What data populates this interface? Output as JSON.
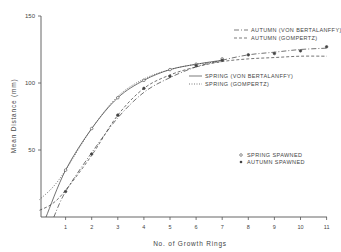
{
  "chart_data": {
    "type": "line",
    "title": "",
    "xlabel": "No. of Growth Rings",
    "ylabel": "Mean Distance (mm)",
    "xlim": [
      0,
      11
    ],
    "ylim": [
      0,
      150
    ],
    "x_ticks": [
      1,
      2,
      3,
      4,
      5,
      6,
      7,
      8,
      9,
      10,
      11
    ],
    "y_ticks": [
      50,
      100,
      150
    ],
    "grid": false,
    "legend_position": "upper-right / center-right",
    "series": [
      {
        "name": "AUTUMN (VON BERTALANFFY)",
        "style": "long-dash-dot",
        "x": [
          0.55,
          1,
          2,
          3,
          4,
          5,
          6,
          7,
          8,
          9,
          10,
          11
        ],
        "y": [
          0,
          19,
          48,
          74,
          93,
          104,
          112,
          117,
          121,
          123,
          125,
          126
        ]
      },
      {
        "name": "AUTUMN (GOMPERTZ)",
        "style": "dashed",
        "x": [
          0,
          0.5,
          1,
          2,
          3,
          4,
          5,
          6,
          7,
          8,
          9,
          10,
          11
        ],
        "y": [
          5,
          10,
          20,
          46,
          76,
          96,
          106,
          112,
          116,
          118,
          119,
          120,
          120
        ]
      },
      {
        "name": "SPRING (VON BERTALANFFY)",
        "style": "solid",
        "x": [
          0.25,
          1,
          2,
          3,
          4,
          5,
          6,
          7
        ],
        "y": [
          0,
          35,
          66,
          89,
          102,
          110,
          114,
          117
        ]
      },
      {
        "name": "SPRING (GOMPERTZ)",
        "style": "dotted",
        "x": [
          0,
          0.5,
          1,
          2,
          3,
          4,
          5,
          6,
          7
        ],
        "y": [
          13,
          22,
          35,
          66,
          90,
          103,
          110,
          114,
          116
        ]
      }
    ],
    "points": [
      {
        "name": "SPRING SPAWNED",
        "marker": "open-circle",
        "x": [
          1,
          2,
          3,
          4,
          5,
          6,
          7
        ],
        "y": [
          35,
          66,
          89,
          102,
          110,
          114,
          118
        ]
      },
      {
        "name": "AUTUMN SPAWNED",
        "marker": "filled-circle",
        "x": [
          1,
          2,
          3,
          4,
          5,
          6,
          7,
          8,
          9,
          10,
          11
        ],
        "y": [
          19,
          47,
          76,
          96,
          105,
          113,
          117,
          121,
          122,
          124,
          127
        ]
      }
    ]
  },
  "legend": {
    "autumn_vb": "AUTUMN (VON BERTALANFFY)",
    "autumn_gomp": "AUTUMN (GOMPERTZ)",
    "spring_vb": "SPRING (VON BERTALANFFY)",
    "spring_gomp": "SPRING (GOMPERTZ)",
    "spring_spawned": "SPRING SPAWNED",
    "autumn_spawned": "AUTUMN SPAWNED"
  },
  "axes": {
    "xlabel": "No. of Growth Rings",
    "ylabel": "Mean Distance (mm)",
    "y_tick_labels": [
      "50",
      "100",
      "150"
    ],
    "x_tick_labels": [
      "1",
      "2",
      "3",
      "4",
      "5",
      "6",
      "7",
      "8",
      "9",
      "10",
      "11"
    ]
  }
}
